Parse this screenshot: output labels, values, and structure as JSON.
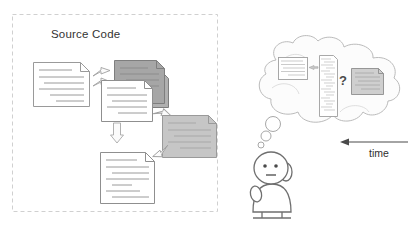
{
  "figure": {
    "type": "diagram",
    "background_color": "#ffffff"
  },
  "source_code_panel": {
    "title": "Source Code",
    "border_style": "dashed",
    "border_color": "#cfcfcf",
    "bounds": {
      "x": 12,
      "y": 14,
      "width": 206,
      "height": 198
    },
    "documents": [
      {
        "name": "document-v1",
        "fill": "#ffffff",
        "stroke": "#9a9a9a",
        "x": 33,
        "y": 62,
        "width": 56,
        "height": 44,
        "lines": 6,
        "folded_corner": true
      },
      {
        "name": "document-v2-dark-stack",
        "fill": "#a8a8a8",
        "stroke": "#7a7a7a",
        "x": 116,
        "y": 60,
        "width": 52,
        "height": 39,
        "lines": 4,
        "folded_corner": true
      },
      {
        "name": "document-v2-dark-back",
        "fill": "#b4b4b4",
        "stroke": "#7a7a7a",
        "x": 112,
        "y": 64,
        "width": 52,
        "height": 39,
        "lines": 0,
        "folded_corner": true
      },
      {
        "name": "document-v2-white",
        "fill": "#ffffff",
        "stroke": "#8f8f8f",
        "x": 101,
        "y": 80,
        "width": 52,
        "height": 41,
        "lines": 5,
        "folded_corner": true
      },
      {
        "name": "document-v3-gray",
        "fill": "#c4c4c4",
        "stroke": "#9a9a9a",
        "x": 162,
        "y": 115,
        "width": 54,
        "height": 42,
        "lines": 5,
        "folded_corner": true
      },
      {
        "name": "document-final",
        "fill": "#ffffff",
        "stroke": "#8f8f8f",
        "x": 100,
        "y": 152,
        "width": 54,
        "height": 52,
        "lines": 7,
        "folded_corner": true
      }
    ],
    "arrows": [
      {
        "name": "arrow-v1-to-v2-upper",
        "direction": "up-right"
      },
      {
        "name": "arrow-v1-to-v2-lower",
        "direction": "down-right"
      },
      {
        "name": "arrow-v2-to-v3",
        "direction": "down-right"
      },
      {
        "name": "arrow-v3-to-final",
        "direction": "down-left"
      },
      {
        "name": "arrow-v2-to-final",
        "direction": "down"
      }
    ]
  },
  "mental_model": {
    "cloud": {
      "name": "thought-cloud",
      "fill": "#fcfcfc",
      "stroke": "#b8b8b8"
    },
    "question_mark": "?",
    "items": [
      {
        "name": "cloud-document-small",
        "fill": "#ffffff",
        "stroke": "#9a9a9a",
        "lines": 5
      },
      {
        "name": "cloud-code-listing",
        "fill": "#ffffff",
        "stroke": "#9a9a9a",
        "lines": 18
      },
      {
        "name": "cloud-document-gray",
        "fill": "#cdcdcd",
        "stroke": "#8a8a8a",
        "lines": 5
      }
    ],
    "thought_bubbles": 3
  },
  "person": {
    "name": "developer-figure",
    "stroke": "#6a6a6a",
    "fill": "#ffffff",
    "features": [
      "head",
      "left-eye",
      "right-eye",
      "mouth",
      "ear",
      "body",
      "arm",
      "legs"
    ]
  },
  "time_axis": {
    "label": "time",
    "direction": "left",
    "arrow_color": "#4a4a4a"
  }
}
